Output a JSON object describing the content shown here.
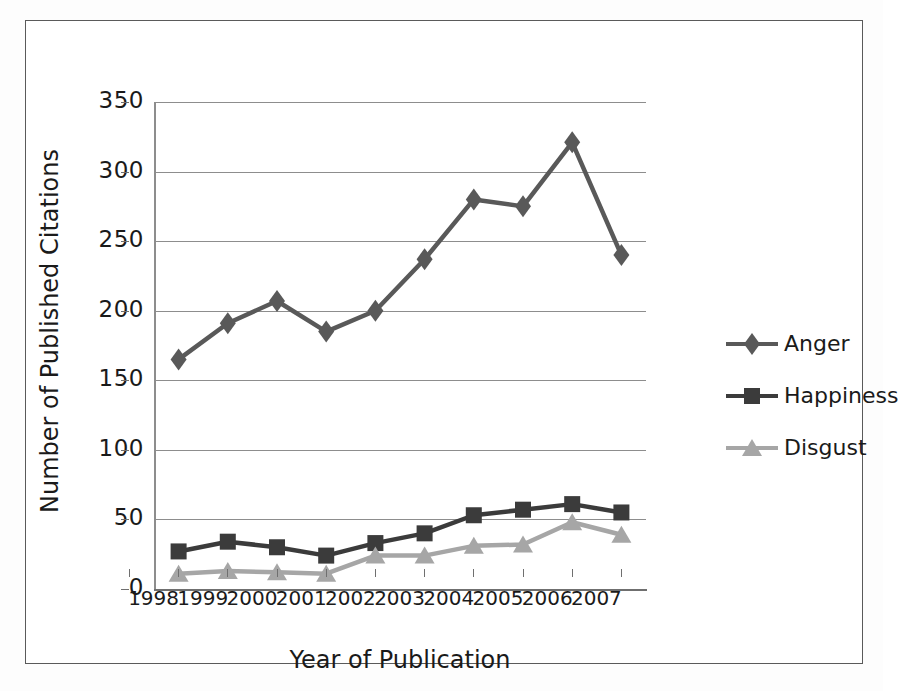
{
  "chart_data": {
    "type": "line",
    "title": "",
    "xlabel": "Year of Publication",
    "ylabel": "Number of Published Citations",
    "categories": [
      "1998",
      "1999",
      "2000",
      "2001",
      "2002",
      "2003",
      "2004",
      "2005",
      "2006",
      "2007"
    ],
    "ylim": [
      0,
      350
    ],
    "ytick_labels": [
      "0",
      "50",
      "100",
      "150",
      "200",
      "250",
      "300",
      "350"
    ],
    "ytick_values": [
      0,
      50,
      100,
      150,
      200,
      250,
      300,
      350
    ],
    "grid": "horizontal",
    "legend_position": "right",
    "series": [
      {
        "name": "Anger",
        "marker": "diamond",
        "color": "#595959",
        "values": [
          165,
          191,
          207,
          185,
          200,
          237,
          280,
          275,
          321,
          240
        ]
      },
      {
        "name": "Happiness",
        "marker": "square",
        "color": "#3b3b3b",
        "values": [
          27,
          34,
          30,
          24,
          33,
          40,
          53,
          57,
          61,
          55
        ]
      },
      {
        "name": "Disgust",
        "marker": "triangle",
        "color": "#a6a6a6",
        "values": [
          11,
          13,
          12,
          11,
          24,
          24,
          31,
          32,
          48,
          39
        ]
      }
    ]
  },
  "legend": {
    "items": [
      {
        "label": "Anger"
      },
      {
        "label": "Happiness"
      },
      {
        "label": "Disgust"
      }
    ]
  },
  "colors": {
    "anger": "#595959",
    "happiness": "#3b3b3b",
    "disgust": "#a6a6a6",
    "grid": "#8d8d8d",
    "axis": "#6f6f6f",
    "frame": "#5a5a5a",
    "text": "#1a1a1a",
    "background": "#ffffff"
  }
}
